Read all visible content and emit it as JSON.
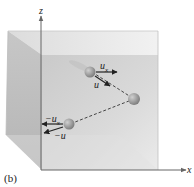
{
  "figure": {
    "caption": "(b)",
    "axes": {
      "z_label": "z",
      "x_label": "x"
    },
    "molecules": [
      {
        "id": "molecule-incoming",
        "vectors": [
          {
            "label": "u",
            "sub": "x"
          },
          {
            "label": "u",
            "sub": ""
          }
        ]
      },
      {
        "id": "molecule-collision"
      },
      {
        "id": "molecule-rebound",
        "vectors": [
          {
            "label": "−u",
            "sub": "x"
          },
          {
            "label": "−u",
            "sub": ""
          }
        ]
      }
    ],
    "labels": {
      "ux_main": "u",
      "ux_sub": "x",
      "u": "u",
      "neg_ux_main": "−u",
      "neg_ux_sub": "x",
      "neg_u": "−u"
    },
    "colors": {
      "box_fill": "#c8c8c8",
      "box_edge": "#b0b0b0",
      "axis": "#555555",
      "molecule": "#8a8a8a",
      "arrow": "#222222"
    }
  }
}
